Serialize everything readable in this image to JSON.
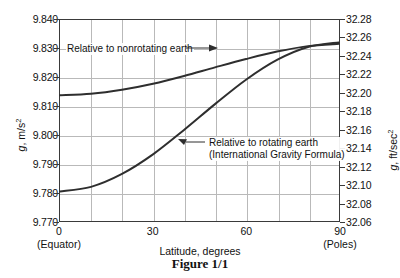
{
  "caption": "Figure 1/1",
  "axes": {
    "x_label": "Latitude, degrees",
    "y_left_label_prefix": "g",
    "y_left_label_suffix": ", m/s",
    "y_left_label_exp": "2",
    "y_right_label_prefix": "g",
    "y_right_label_suffix": ", ft/sec",
    "y_right_label_exp": "2",
    "x_ticks": [
      {
        "value": 0,
        "label": "0",
        "sub": "(Equator)"
      },
      {
        "value": 30,
        "label": "30",
        "sub": ""
      },
      {
        "value": 60,
        "label": "60",
        "sub": ""
      },
      {
        "value": 90,
        "label": "90",
        "sub": "(Poles)"
      }
    ],
    "y_left_ticks": [
      "9.840",
      "9.830",
      "9.820",
      "9.810",
      "9.800",
      "9.790",
      "9.780",
      "9.770"
    ],
    "y_right_ticks": [
      "32.28",
      "32.26",
      "32.24",
      "32.22",
      "32.20",
      "32.18",
      "32.16",
      "32.14",
      "32.12",
      "32.10",
      "32.08",
      "32.06"
    ]
  },
  "annotations": {
    "nonrotating": "Relative to nonrotating earth",
    "rotating_line1": "Relative to rotating earth",
    "rotating_line2": "(International Gravity Formula)"
  },
  "colors": {
    "curve": "#2e2e2e",
    "grid": "#b9b9b9",
    "frame": "#3a3a3a"
  },
  "chart_data": {
    "type": "line",
    "title": "Figure 1/1",
    "xlabel": "Latitude, degrees",
    "ylabel": "g, m/s^2",
    "ylabel_secondary": "g, ft/sec^2",
    "xlim": [
      0,
      90
    ],
    "ylim": [
      9.77,
      9.84
    ],
    "ylim_secondary": [
      32.06,
      32.28
    ],
    "grid": true,
    "legend": "annotations-on-plot",
    "x": [
      0,
      10,
      20,
      30,
      40,
      50,
      60,
      70,
      80,
      90
    ],
    "series": [
      {
        "name": "Relative to nonrotating earth",
        "values": [
          9.8138,
          9.8143,
          9.8157,
          9.8178,
          9.8205,
          9.8235,
          9.8264,
          9.829,
          9.8309,
          9.8317
        ]
      },
      {
        "name": "Relative to rotating earth (International Gravity Formula)",
        "values": [
          9.7803,
          9.7819,
          9.7864,
          9.7932,
          9.8017,
          9.8107,
          9.8192,
          9.8261,
          9.8306,
          9.8322
        ]
      }
    ]
  }
}
